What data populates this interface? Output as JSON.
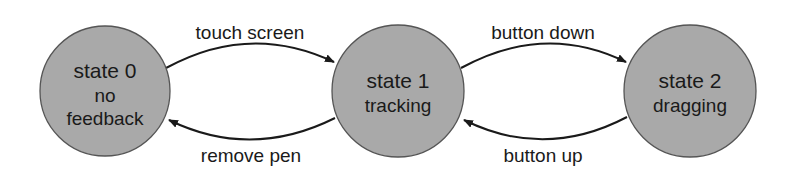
{
  "diagram": {
    "type": "state-transition",
    "colors": {
      "state_fill": "#a9a9a9",
      "state_stroke": "#555555",
      "edge": "#1a1a1a",
      "text": "#1a1a1a",
      "background": "#ffffff"
    },
    "states": [
      {
        "id": "state-0",
        "title": "state 0",
        "lines": [
          "no",
          "feedback"
        ]
      },
      {
        "id": "state-1",
        "title": "state 1",
        "lines": [
          "tracking"
        ]
      },
      {
        "id": "state-2",
        "title": "state 2",
        "lines": [
          "dragging"
        ]
      }
    ],
    "transitions": [
      {
        "from": "state-0",
        "to": "state-1",
        "label": "touch screen",
        "position": "top"
      },
      {
        "from": "state-1",
        "to": "state-0",
        "label": "remove pen",
        "position": "bottom"
      },
      {
        "from": "state-1",
        "to": "state-2",
        "label": "button down",
        "position": "top"
      },
      {
        "from": "state-2",
        "to": "state-1",
        "label": "button up",
        "position": "bottom"
      }
    ]
  }
}
